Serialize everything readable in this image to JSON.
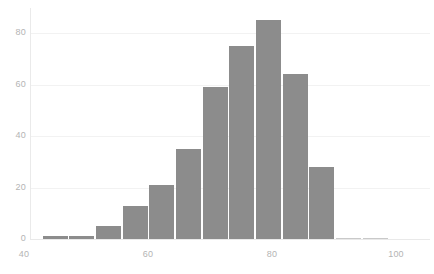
{
  "chart_data": {
    "type": "bar",
    "title": "",
    "subtitle": "",
    "xlabel": "",
    "ylabel": "",
    "xlim": [
      40.5,
      101.5
    ],
    "ylim": [
      0,
      90
    ],
    "grid": true,
    "legend": null,
    "legend_position": "none",
    "bar_color": "#8c8c8c",
    "grid_color": "#f2f2f2",
    "tick_label_color": "#b4b4b4",
    "background_color": "#ffffff",
    "x_ticks": [
      40,
      60,
      80,
      100
    ],
    "x_tick_labels": [
      "40",
      "60",
      "80",
      "100"
    ],
    "y_ticks": [
      0,
      20,
      40,
      60,
      80
    ],
    "y_tick_labels": [
      "0",
      "20",
      "40",
      "60",
      "80"
    ],
    "bin_width": 4.3,
    "bins": [
      {
        "x_left": 43.0,
        "x_right": 47.3,
        "value": 1
      },
      {
        "x_left": 47.3,
        "x_right": 51.6,
        "value": 1
      },
      {
        "x_left": 51.6,
        "x_right": 55.9,
        "value": 5
      },
      {
        "x_left": 55.9,
        "x_right": 60.2,
        "value": 13
      },
      {
        "x_left": 60.2,
        "x_right": 64.5,
        "value": 21
      },
      {
        "x_left": 64.5,
        "x_right": 68.8,
        "value": 35
      },
      {
        "x_left": 68.8,
        "x_right": 73.1,
        "value": 59
      },
      {
        "x_left": 73.1,
        "x_right": 77.4,
        "value": 75
      },
      {
        "x_left": 77.4,
        "x_right": 81.7,
        "value": 85
      },
      {
        "x_left": 81.7,
        "x_right": 86.0,
        "value": 64
      },
      {
        "x_left": 86.0,
        "x_right": 90.3,
        "value": 28
      },
      {
        "x_left": 90.3,
        "x_right": 94.6,
        "value": 0
      },
      {
        "x_left": 94.6,
        "x_right": 98.9,
        "value": 0
      }
    ],
    "categories": [
      "43-47.3",
      "47.3-51.6",
      "51.6-55.9",
      "55.9-60.2",
      "60.2-64.5",
      "64.5-68.8",
      "68.8-73.1",
      "73.1-77.4",
      "77.4-81.7",
      "81.7-86",
      "86-90.3",
      "90.3-94.6",
      "94.6-98.9"
    ],
    "values": [
      1,
      1,
      5,
      13,
      21,
      35,
      59,
      75,
      85,
      64,
      28,
      0,
      0
    ]
  }
}
